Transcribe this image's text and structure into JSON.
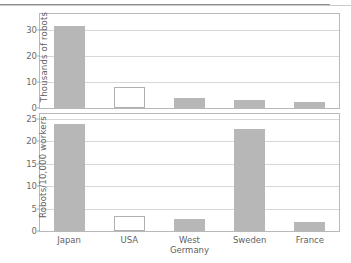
{
  "figure": {
    "categories": [
      "Japan",
      "USA",
      "West Germany",
      "Sweden",
      "France"
    ],
    "category_lines": [
      [
        "Japan",
        ""
      ],
      [
        "USA",
        ""
      ],
      [
        "West",
        "Germany"
      ],
      [
        "Sweden",
        ""
      ],
      [
        "France",
        ""
      ]
    ],
    "bar_fill": "#b7b7b7",
    "bar_highlight_fill": "#ffffff",
    "highlight_category": "USA",
    "panels": [
      {
        "id": "top",
        "ylabel": "Thousands of robots",
        "yticks": [
          0,
          10,
          20,
          30
        ],
        "ylim": [
          0,
          36
        ],
        "values": [
          31.5,
          8.2,
          3.8,
          3.2,
          2.2
        ]
      },
      {
        "id": "bottom",
        "ylabel": "Robots/10,000 workers",
        "yticks": [
          0,
          5,
          10,
          15,
          20,
          25
        ],
        "ylim": [
          0,
          26
        ],
        "values": [
          23.8,
          3.3,
          2.6,
          22.7,
          2.0
        ]
      }
    ]
  },
  "chart_data": [
    {
      "type": "bar",
      "title": "",
      "xlabel": "",
      "ylabel": "Thousands of robots",
      "categories": [
        "Japan",
        "USA",
        "West Germany",
        "Sweden",
        "France"
      ],
      "values": [
        31.5,
        8.2,
        3.8,
        3.2,
        2.2
      ],
      "yticks": [
        0,
        10,
        20,
        30
      ],
      "ylim": [
        0,
        36
      ],
      "grid": true,
      "legend": "none",
      "notes": "USA bar drawn unfilled (white with gray outline); all other bars solid gray"
    },
    {
      "type": "bar",
      "title": "",
      "xlabel": "",
      "ylabel": "Robots/10,000 workers",
      "categories": [
        "Japan",
        "USA",
        "West Germany",
        "Sweden",
        "France"
      ],
      "values": [
        23.8,
        3.3,
        2.6,
        22.7,
        2.0
      ],
      "yticks": [
        0,
        5,
        10,
        15,
        20,
        25
      ],
      "ylim": [
        0,
        26
      ],
      "grid": true,
      "legend": "none",
      "notes": "USA bar drawn unfilled (white with gray outline); all other bars solid gray"
    }
  ]
}
